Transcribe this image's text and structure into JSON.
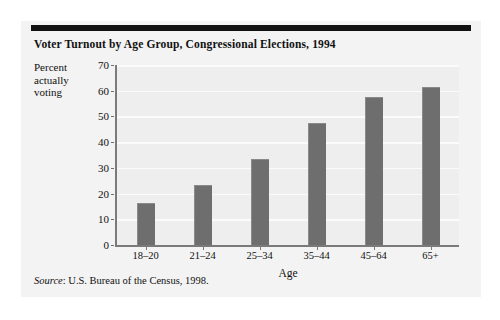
{
  "figure": {
    "title": "Voter Turnout by Age Group, Congressional Elections, 1994",
    "source_lead": "Source",
    "source_text": ": U.S. Bureau of the Census, 1998."
  },
  "y_axis_title_lines": {
    "l1": "Percent",
    "l2": "actually",
    "l3": "voting"
  },
  "colors": {
    "bar_fill": "#6e6e6e",
    "plot_background": "#eeeeee",
    "gridline": "#fbfbfb",
    "axis_line": "#7a7a7a",
    "page_background": "#f3f3f3",
    "top_rule": "#111111",
    "text": "#111111"
  },
  "chart_data": {
    "type": "bar",
    "title": "Voter Turnout by Age Group, Congressional Elections, 1994",
    "subtitle": "",
    "xlabel": "Age",
    "ylabel": "Percent actually voting",
    "categories": [
      "18–20",
      "21–24",
      "25–34",
      "35–44",
      "45–64",
      "65+"
    ],
    "values": [
      16,
      23,
      33,
      47,
      57,
      61
    ],
    "ylim": [
      0,
      70
    ],
    "yticks": [
      0,
      10,
      20,
      30,
      40,
      50,
      60,
      70
    ],
    "ytick_labels": [
      "0",
      "10",
      "20",
      "30",
      "40",
      "50",
      "60",
      "70"
    ],
    "grid": true,
    "grid_axis": "y",
    "legend": false,
    "legend_position": "none",
    "orientation": "vertical",
    "series": [
      {
        "name": "Percent actually voting",
        "values": [
          16,
          23,
          33,
          47,
          57,
          61
        ]
      }
    ]
  }
}
